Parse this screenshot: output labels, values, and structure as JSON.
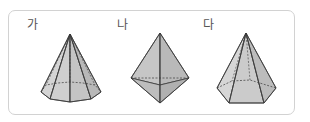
{
  "figure": {
    "shapes": [
      {
        "label": "가",
        "kind": "octagonal-pyramid"
      },
      {
        "label": "나",
        "kind": "triangular-bipyramid"
      },
      {
        "label": "다",
        "kind": "hexagonal-pyramid"
      }
    ]
  },
  "colors": {
    "fill_front": "#c9c9c9",
    "fill_side": "#b5b5b5",
    "fill_light": "#dadada",
    "edge": "#3a3a3a",
    "frame_border": "#d2d2d2"
  }
}
